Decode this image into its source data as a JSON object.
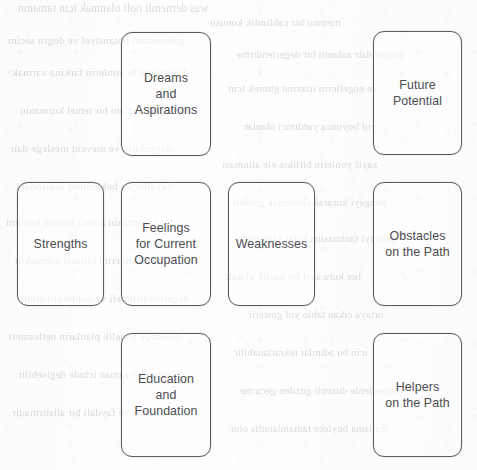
{
  "document": {
    "type": "scanned-worksheet-diagram",
    "page_background": "#fdfdfc",
    "ink_color": "#4c4c50",
    "border_color": "#5c5c60",
    "bleed_text_color": "#8e8e92"
  },
  "diagram": {
    "name": "career-reflection-card-layout",
    "rows": 3,
    "columns": 4,
    "boxes": [
      {
        "id": "dreams-and-aspirations",
        "label": "Dreams\nand\nAspirations",
        "row": 1,
        "column": 2,
        "x": 121,
        "y": 32,
        "width": 90,
        "height": 124
      },
      {
        "id": "future-potential",
        "label": "Future\nPotential",
        "row": 1,
        "column": 4,
        "x": 373,
        "y": 31,
        "width": 89,
        "height": 124
      },
      {
        "id": "strengths",
        "label": "Strengths",
        "row": 2,
        "column": 1,
        "x": 17,
        "y": 182,
        "width": 87,
        "height": 124
      },
      {
        "id": "feelings-for-current-occupation",
        "label": "Feelings\nfor Current\nOccupation",
        "row": 2,
        "column": 2,
        "x": 121,
        "y": 182,
        "width": 90,
        "height": 124
      },
      {
        "id": "weaknesses",
        "label": "Weaknesses",
        "row": 2,
        "column": 3,
        "x": 228,
        "y": 182,
        "width": 87,
        "height": 124
      },
      {
        "id": "obstacles-on-the-path",
        "label": "Obstacles\non the Path",
        "row": 2,
        "column": 4,
        "x": 373,
        "y": 182,
        "width": 89,
        "height": 124
      },
      {
        "id": "education-and-foundation",
        "label": "Education\nand\nFoundation",
        "row": 3,
        "column": 2,
        "x": 121,
        "y": 333,
        "width": 90,
        "height": 124
      },
      {
        "id": "helpers-on-the-path",
        "label": "Helpers\non the Path",
        "row": 3,
        "column": 4,
        "x": 373,
        "y": 333,
        "width": 89,
        "height": 124
      }
    ]
  },
  "bleed_through": {
    "description": "faint mirrored text showing through from the reverse side of the printed page; illegible in the scan",
    "lines": [
      {
        "x": 18,
        "y": 2,
        "text": "was dernemli ooli olanmak icin tamamn",
        "size": 11.5
      },
      {
        "x": 210,
        "y": 16,
        "text": "memnu bir cahlimlik konusu",
        "size": 11.0
      },
      {
        "x": 8,
        "y": 34,
        "text": "gelecekteki potansiyel ve dogru secim",
        "size": 11.2
      },
      {
        "x": 236,
        "y": 48,
        "text": "surece dair anlamli bir degerlendirme",
        "size": 10.8
      },
      {
        "x": 12,
        "y": 66,
        "text": "kisisel guclu yonlerin farkina varmak",
        "size": 11.3
      },
      {
        "x": 228,
        "y": 82,
        "text": "ve engellerin uzerine gitmek icin",
        "size": 11.0
      },
      {
        "x": 20,
        "y": 104,
        "text": "egitim ile saglam bir temel kurmanin",
        "size": 11.1
      },
      {
        "x": 244,
        "y": 120,
        "text": "yol boyunca yardimci olanlar",
        "size": 10.9
      },
      {
        "x": 10,
        "y": 142,
        "text": "duygularin ve mevcut meslege dair",
        "size": 11.2
      },
      {
        "x": 222,
        "y": 158,
        "text": "zayif yonlerin birlikte ele alinmasi",
        "size": 10.9
      },
      {
        "x": 16,
        "y": 180,
        "text": "hayaller ve beklentiler arasindaki",
        "size": 11.4
      },
      {
        "x": 232,
        "y": 196,
        "text": "dengeyi kurarak ilerlemek gerekir",
        "size": 11.0
      },
      {
        "x": 6,
        "y": 216,
        "text": "bu calismanin amaci kisinin kendini",
        "size": 11.2
      },
      {
        "x": 240,
        "y": 232,
        "text": "daha iyi tanimasina katki saglamak",
        "size": 10.8
      },
      {
        "x": 14,
        "y": 254,
        "text": "ve secimlerini bilincli yapmaktir",
        "size": 11.1
      },
      {
        "x": 226,
        "y": 270,
        "text": "her kutu ayri bir baslik olarak",
        "size": 11.0
      },
      {
        "x": 20,
        "y": 292,
        "text": "degerlendirilmeli ve doldurulmalidir",
        "size": 11.2
      },
      {
        "x": 248,
        "y": 308,
        "text": "ortaya cikan tablo yol gosterir",
        "size": 10.9
      },
      {
        "x": 8,
        "y": 330,
        "text": "gelecege yonelik planlarin netlesmesi",
        "size": 11.1
      },
      {
        "x": 234,
        "y": 346,
        "text": "icin bu adimlar tekrarlanabilir",
        "size": 10.8
      },
      {
        "x": 18,
        "y": 368,
        "text": "sonuclar zaman icinde degisebilir",
        "size": 11.0
      },
      {
        "x": 240,
        "y": 384,
        "text": "bu nedenle duzenli gozden gecirme",
        "size": 10.9
      },
      {
        "x": 12,
        "y": 406,
        "text": "onerilir ve faydali bir alistirmadir",
        "size": 11.1
      },
      {
        "x": 230,
        "y": 422,
        "text": "calisma boylece tamamlanmis olur",
        "size": 10.8
      }
    ]
  }
}
